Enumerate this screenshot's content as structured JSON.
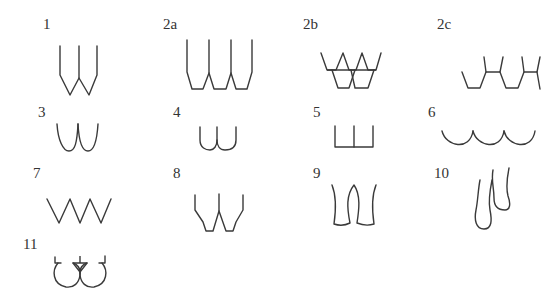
{
  "diagram": {
    "title": "",
    "stroke_color": "#3a3a3a",
    "background": "#ffffff",
    "figures": [
      {
        "id": "1",
        "label": "1",
        "shape": "double-pointed-w"
      },
      {
        "id": "2a",
        "label": "2a",
        "shape": "triple-flat-bottom-u"
      },
      {
        "id": "2b",
        "label": "2b",
        "shape": "overlapping-crowns"
      },
      {
        "id": "2c",
        "label": "2c",
        "shape": "linked-hexagonal-chain"
      },
      {
        "id": "3",
        "label": "3",
        "shape": "double-round-u"
      },
      {
        "id": "4",
        "label": "4",
        "shape": "double-short-u"
      },
      {
        "id": "5",
        "label": "5",
        "shape": "double-square-u"
      },
      {
        "id": "6",
        "label": "6",
        "shape": "triple-scallop"
      },
      {
        "id": "7",
        "label": "7",
        "shape": "zigzag"
      },
      {
        "id": "8",
        "label": "8",
        "shape": "double-flat-bottom-v"
      },
      {
        "id": "9",
        "label": "9",
        "shape": "double-flared-roots"
      },
      {
        "id": "10",
        "label": "10",
        "shape": "double-teardrop-roots"
      },
      {
        "id": "11",
        "label": "11",
        "shape": "double-loop-with-ticks"
      }
    ]
  }
}
